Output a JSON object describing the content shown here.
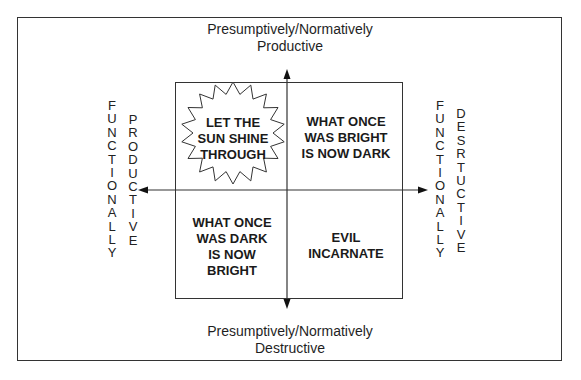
{
  "diagram": {
    "top_label": [
      "Presumptively/Normatively",
      "Productive"
    ],
    "bottom_label": [
      "Presumptively/Normatively",
      "Destructive"
    ],
    "left_label": {
      "outer": [
        "F",
        "U",
        "N",
        "C",
        "T",
        "I",
        "O",
        "N",
        "A",
        "L",
        "L",
        "Y"
      ],
      "inner": [
        "P",
        "R",
        "O",
        "D",
        "U",
        "C",
        "T",
        "I",
        "V",
        "E"
      ]
    },
    "right_label": {
      "outer": [
        "F",
        "U",
        "N",
        "C",
        "T",
        "I",
        "O",
        "N",
        "A",
        "L",
        "L",
        "Y"
      ],
      "inner": [
        "D",
        "E",
        "S",
        "R",
        "T",
        "U",
        "C",
        "T",
        "I",
        "V",
        "E"
      ]
    },
    "quadrants": {
      "top_left": [
        "LET THE",
        "SUN SHINE",
        "THROUGH"
      ],
      "top_right": [
        "WHAT ONCE",
        "WAS BRIGHT",
        "IS NOW DARK"
      ],
      "bottom_left": [
        "WHAT ONCE",
        "WAS DARK",
        "IS NOW",
        "BRIGHT"
      ],
      "bottom_right": [
        "EVIL",
        "INCARNATE"
      ]
    },
    "top_left_shape": "starburst",
    "line_color": "#333333"
  }
}
